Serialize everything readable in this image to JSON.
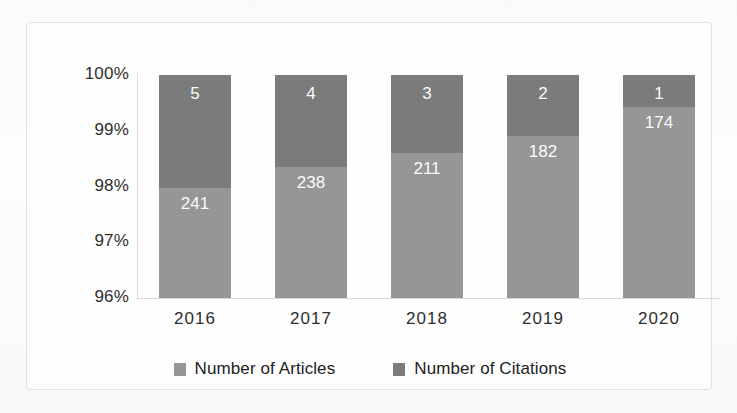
{
  "chart_data": {
    "type": "bar",
    "subtype": "100% stacked column",
    "title": "",
    "xlabel": "",
    "ylabel": "",
    "categories": [
      "2016",
      "2017",
      "2018",
      "2019",
      "2020"
    ],
    "ylim": [
      96,
      100
    ],
    "ytick_labels": [
      "100%",
      "99%",
      "98%",
      "97%",
      "96%"
    ],
    "ytick_values": [
      100,
      99,
      98,
      97,
      96
    ],
    "ytick_suffix": "%",
    "grid": false,
    "legend_position": "bottom",
    "series": [
      {
        "name": "Number of Articles",
        "color": "#969696",
        "values": [
          241,
          238,
          211,
          182,
          174
        ],
        "percent_of_total": [
          97.97,
          98.35,
          98.6,
          98.91,
          99.43
        ]
      },
      {
        "name": "Number of Citations",
        "color": "#7b7b7b",
        "values": [
          5,
          4,
          3,
          2,
          1
        ],
        "percent_of_total": [
          2.03,
          1.65,
          1.4,
          1.09,
          0.57
        ]
      }
    ],
    "totals": [
      246,
      242,
      214,
      184,
      175
    ]
  },
  "axis": {
    "y_ticks": [
      {
        "label": "100%"
      },
      {
        "label": "99%"
      },
      {
        "label": "98%"
      },
      {
        "label": "97%"
      },
      {
        "label": "96%"
      }
    ],
    "x_ticks": [
      {
        "label": "2016"
      },
      {
        "label": "2017"
      },
      {
        "label": "2018"
      },
      {
        "label": "2019"
      },
      {
        "label": "2020"
      }
    ]
  },
  "bars": [
    {
      "category": "2016",
      "citations_label": "5",
      "articles_label": "241",
      "citations_pct": 2.03,
      "articles_pct": 97.97
    },
    {
      "category": "2017",
      "citations_label": "4",
      "articles_label": "238",
      "citations_pct": 1.65,
      "articles_pct": 98.35
    },
    {
      "category": "2018",
      "citations_label": "3",
      "articles_label": "211",
      "citations_pct": 1.4,
      "articles_pct": 98.6
    },
    {
      "category": "2019",
      "citations_label": "2",
      "articles_label": "182",
      "citations_pct": 1.09,
      "articles_pct": 98.91
    },
    {
      "category": "2020",
      "citations_label": "1",
      "articles_label": "174",
      "citations_pct": 0.57,
      "articles_pct": 99.43
    }
  ],
  "legend": {
    "items": [
      {
        "label": "Number of Articles",
        "color": "#969696"
      },
      {
        "label": "Number of Citations",
        "color": "#7b7b7b"
      }
    ]
  },
  "colors": {
    "articles": "#969696",
    "citations": "#7b7b7b",
    "frame_border": "#e2e2e2",
    "axis": "#d8d8d8",
    "text": "#2e2e2e",
    "data_label": "#ffffff",
    "background": "#fdfdfc"
  }
}
